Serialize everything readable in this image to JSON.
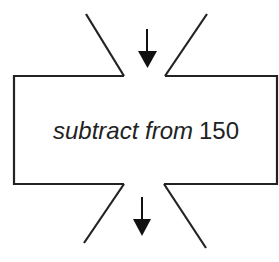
{
  "diagram": {
    "type": "function-machine",
    "operation_text": "subtract from",
    "operand": "150",
    "input_arrow": "down-arrow",
    "output_arrow": "down-arrow",
    "colors": {
      "stroke": "#222222",
      "background": "#ffffff",
      "text": "#222222"
    }
  }
}
